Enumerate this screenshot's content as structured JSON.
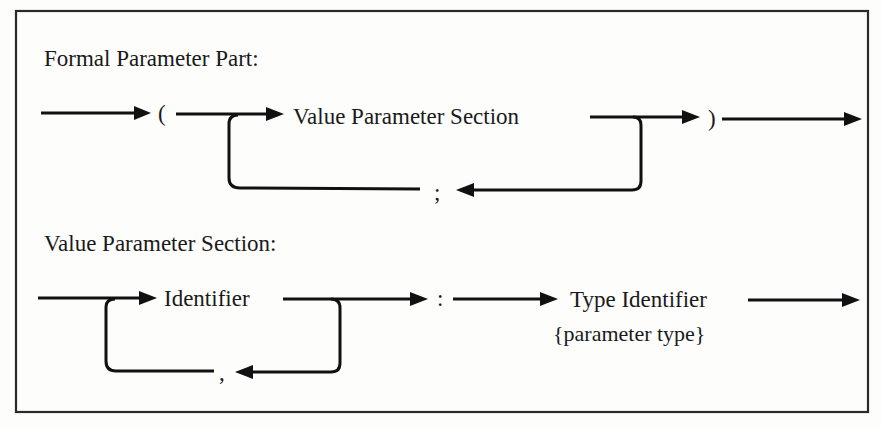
{
  "diagram_type": "syntax-diagram",
  "colors": {
    "ink": "#111111",
    "background": "#fdfdfc",
    "frame": "#2a2a2a"
  },
  "formal_parameter_part": {
    "title": "Formal Parameter Part:",
    "open_paren": "(",
    "node": "Value Parameter Section",
    "separator": ";",
    "close_paren": ")"
  },
  "value_parameter_section": {
    "title": "Value Parameter Section:",
    "node": "Identifier",
    "separator": ",",
    "colon": ":",
    "type_node": "Type Identifier",
    "type_note": "{parameter type}"
  }
}
